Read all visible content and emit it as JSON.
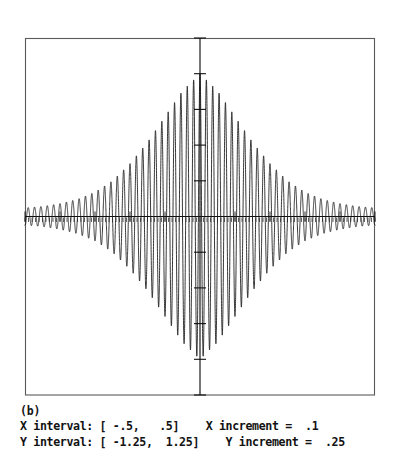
{
  "figure": {
    "panel_label": "(b)",
    "caption_lines": [
      "X interval: [ -.5,   .5]    X increment =  .1",
      "Y interval: [ -1.25,  1.25]    Y increment =  .25"
    ],
    "caption_fields": {
      "x_interval_label": "X interval:",
      "x_interval_min": "-.5",
      "x_interval_max": ".5",
      "x_increment_label": "X increment =",
      "x_increment_value": ".1",
      "y_interval_label": "Y interval:",
      "y_interval_min": "-1.25",
      "y_interval_max": "1.25",
      "y_increment_label": "Y increment =",
      "y_increment_value": ".25"
    }
  },
  "chart_data": {
    "type": "line",
    "title": "",
    "subtitle": "(b)",
    "xlabel": "",
    "ylabel": "",
    "xlim": [
      -0.5,
      0.5
    ],
    "ylim": [
      -1.25,
      1.25
    ],
    "x_increment": 0.1,
    "y_increment": 0.25,
    "grid": false,
    "legend": null,
    "axes_style": "centered-crosshair-with-ticks-inside-box-frame",
    "frame": {
      "left_px": 25,
      "top_px": 38,
      "right_px": 375,
      "bottom_px": 395,
      "stroke": "#555555"
    },
    "axis_lines": {
      "x_axis_y_value": 0,
      "y_axis_x_value": 0,
      "stroke": "#1a1a1a"
    },
    "x_ticks": [
      -0.5,
      -0.4,
      -0.3,
      -0.2,
      -0.1,
      0,
      0.1,
      0.2,
      0.3,
      0.4,
      0.5
    ],
    "x_minor_tick_count": 100,
    "y_ticks": [
      -1.25,
      -1.0,
      -0.75,
      -0.5,
      -0.25,
      0,
      0.25,
      0.5,
      0.75,
      1.0,
      1.25
    ],
    "tick_labels_shown": false,
    "series": [
      {
        "name": "damped high-frequency oscillation",
        "stroke": "#151515",
        "description": "rapid sinusoid of ~55 cycles across the interval modulated by a peaked (cusp-like) envelope centred at x=0 reaching amplitude 1.0, falling to about 0.07 at the interval ends",
        "envelope_amplitude_at_x": {
          "-0.50": 0.06,
          "-0.45": 0.07,
          "-0.40": 0.09,
          "-0.35": 0.12,
          "-0.30": 0.17,
          "-0.25": 0.25,
          "-0.20": 0.37,
          "-0.15": 0.52,
          "-0.10": 0.7,
          "-0.05": 0.88,
          "0.00": 1.0,
          "0.05": 0.88,
          "0.10": 0.7,
          "0.15": 0.52,
          "0.20": 0.37,
          "0.25": 0.25,
          "0.30": 0.17,
          "0.35": 0.12,
          "0.40": 0.09,
          "0.45": 0.07,
          "0.50": 0.06
        },
        "carrier_cycles_over_interval": 55,
        "peak_value": 1.0,
        "min_value": -1.0
      }
    ]
  }
}
